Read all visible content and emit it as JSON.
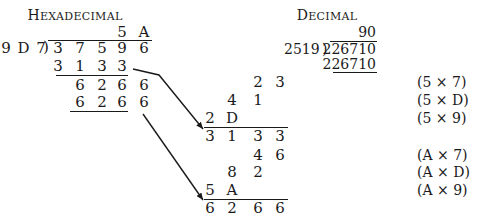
{
  "hex": {
    "title_first": "H",
    "title_rest": "EXADECIMAL",
    "quotient": [
      "5",
      "A"
    ],
    "divisor": "9 D 7",
    "bracket": ")",
    "dividend": [
      "3",
      "7",
      "5",
      "9",
      "6"
    ],
    "product1": [
      "3",
      "1",
      "3",
      "3"
    ],
    "remainder1": [
      "6",
      "2",
      "6",
      "6"
    ],
    "product2": [
      "6",
      "2",
      "6",
      "6"
    ]
  },
  "decimal": {
    "title_first": "D",
    "title_rest": "ECIMAL",
    "quotient": "90",
    "divisor": "2519",
    "bracket": ")",
    "dividend": "226710",
    "product": "226710"
  },
  "partials": {
    "block1": {
      "rows": [
        {
          "cells": [
            "",
            "",
            "2",
            "3"
          ],
          "note": "(5 × 7)"
        },
        {
          "cells": [
            "",
            "4",
            "1",
            ""
          ],
          "note": "(5 × D)"
        },
        {
          "cells": [
            "2",
            "D",
            "",
            ""
          ],
          "note": "(5 × 9)"
        }
      ],
      "sum": [
        "3",
        "1",
        "3",
        "3"
      ]
    },
    "block2": {
      "rows": [
        {
          "cells": [
            "",
            "",
            "4",
            "6"
          ],
          "note": "(A × 7)"
        },
        {
          "cells": [
            "",
            "8",
            "2",
            ""
          ],
          "note": "(A × D)"
        },
        {
          "cells": [
            "5",
            "A",
            "",
            ""
          ],
          "note": "(A × 9)"
        }
      ],
      "sum": [
        "6",
        "2",
        "6",
        "6"
      ]
    }
  }
}
